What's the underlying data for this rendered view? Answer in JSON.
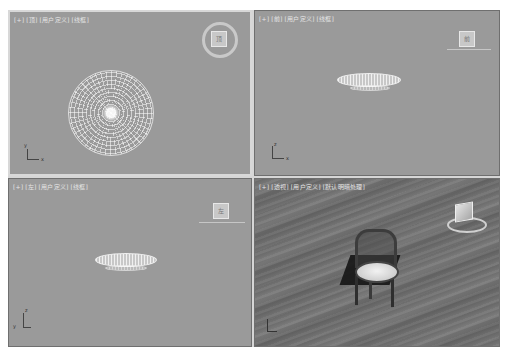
{
  "app": "3ds Max",
  "viewports": [
    {
      "id": "top",
      "labels": [
        "[+]",
        "[顶]",
        "[用户定义]",
        "[线框]"
      ],
      "active": true,
      "viewcube_face": "顶",
      "axis": {
        "vertical": "y",
        "horizontal": "x"
      }
    },
    {
      "id": "front",
      "labels": [
        "[+]",
        "[前]",
        "[用户定义]",
        "[线框]"
      ],
      "active": false,
      "viewcube_face": "前",
      "axis": {
        "vertical": "z",
        "horizontal": "x"
      }
    },
    {
      "id": "left",
      "labels": [
        "[+]",
        "[左]",
        "[用户定义]",
        "[线框]"
      ],
      "active": false,
      "viewcube_face": "左",
      "axis": {
        "vertical": "z",
        "horizontal": "y"
      }
    },
    {
      "id": "perspective",
      "labels": [
        "[+]",
        "[透视]",
        "[用户定义]",
        "[默认明暗处理]"
      ],
      "active": false,
      "viewcube_face": "",
      "axis": {
        "vertical": "z",
        "horizontal": "x"
      }
    }
  ],
  "colors": {
    "viewport_bg": "#9a9a9a",
    "active_border": "#d8d8d8",
    "wireframe": "#ffffff",
    "floor": "#727272"
  }
}
